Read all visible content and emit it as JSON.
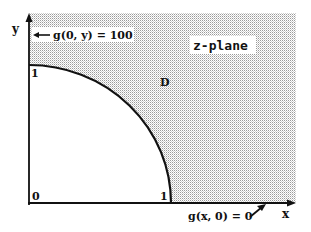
{
  "diagram": {
    "plane_label": "z-plane",
    "region_label": "D",
    "axes": {
      "x_label": "x",
      "y_label": "y",
      "origin_label": "0",
      "x_tick_label": "1",
      "y_tick_label": "1"
    },
    "boundary_conditions": {
      "y_axis": "g(0, y) = 100",
      "x_axis": "g(x, 0) = 0"
    },
    "colors": {
      "shading": "#c8c8c8",
      "lines": "#111111",
      "background": "#ffffff"
    }
  }
}
